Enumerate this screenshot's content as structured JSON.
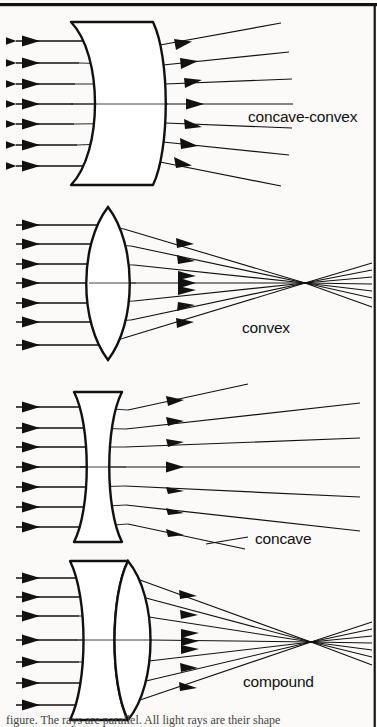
{
  "figure": {
    "background_color": "#fbfaf8",
    "ink_color": "#111111",
    "border": {
      "top": true,
      "right": true,
      "color": "#111111"
    },
    "caption_fragment": "figure. The rays are parallel. All light rays are their shape"
  },
  "panels": [
    {
      "id": "concave-convex",
      "label": "concave-convex",
      "label_x": 248,
      "label_y": 122,
      "lens_type": "meniscus",
      "behavior": "diverging",
      "ray_count": 7,
      "focal_point": null,
      "has_leader_line": false
    },
    {
      "id": "convex",
      "label": "convex",
      "label_x": 242,
      "label_y": 333,
      "lens_type": "biconvex",
      "behavior": "converging",
      "ray_count": 7,
      "focal_point": {
        "x": 305,
        "y": 283
      },
      "has_leader_line": false
    },
    {
      "id": "concave",
      "label": "concave",
      "label_x": 255,
      "label_y": 539,
      "lens_type": "biconcave",
      "behavior": "diverging",
      "ray_count": 7,
      "focal_point": null,
      "has_leader_line": true
    },
    {
      "id": "compound",
      "label": "compound",
      "label_x": 243,
      "label_y": 687,
      "lens_type": "compound-doublet",
      "behavior": "converging",
      "ray_count": 7,
      "focal_point": {
        "x": 311,
        "y": 642
      },
      "has_leader_line": false
    }
  ],
  "icons": {
    "arrowhead": "solid-triangle-right"
  }
}
